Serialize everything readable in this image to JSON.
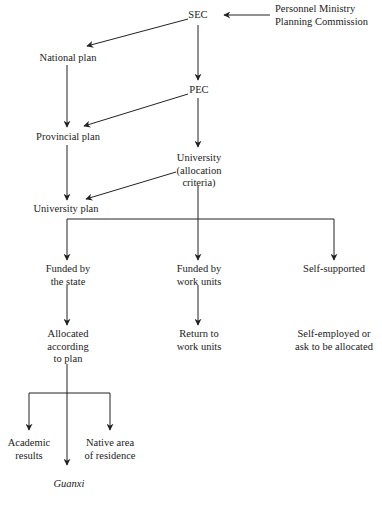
{
  "diagram": {
    "nodes": {
      "sec": "SEC",
      "personnel": [
        "Personnel Ministry",
        "Planning Commission"
      ],
      "national_plan": "National plan",
      "pec": "PEC",
      "provincial_plan": "Provincial plan",
      "university": [
        "University",
        "(allocation",
        "criteria)"
      ],
      "university_plan": "University plan",
      "funded_state": [
        "Funded by",
        "the state"
      ],
      "funded_work_units": [
        "Funded by",
        "work units"
      ],
      "self_supported": "Self-supported",
      "allocated_plan": [
        "Allocated",
        "according",
        "to plan"
      ],
      "return_work_units": [
        "Return to",
        "work units"
      ],
      "self_employed": [
        "Self-employed or",
        "ask to be allocated"
      ],
      "academic_results": [
        "Academic",
        "results"
      ],
      "native_area": [
        "Native area",
        "of residence"
      ],
      "guanxi": "Guanxi"
    },
    "edges": [
      [
        "Personnel Ministry / Planning Commission",
        "SEC"
      ],
      [
        "SEC",
        "National plan"
      ],
      [
        "SEC",
        "PEC"
      ],
      [
        "National plan",
        "Provincial plan"
      ],
      [
        "PEC",
        "Provincial plan"
      ],
      [
        "PEC",
        "University (allocation criteria)"
      ],
      [
        "Provincial plan",
        "University plan"
      ],
      [
        "University (allocation criteria)",
        "University plan"
      ],
      [
        "University plan",
        "Funded by the state"
      ],
      [
        "University plan",
        "Funded by work units"
      ],
      [
        "University plan",
        "Self-supported"
      ],
      [
        "Funded by the state",
        "Allocated according to plan"
      ],
      [
        "Funded by work units",
        "Return to work units"
      ],
      [
        "Allocated according to plan",
        "Academic results"
      ],
      [
        "Allocated according to plan",
        "Guanxi"
      ],
      [
        "Allocated according to plan",
        "Native area of residence"
      ]
    ],
    "colors": {
      "line": "#222222",
      "text": "#222222",
      "background": "#ffffff"
    }
  }
}
